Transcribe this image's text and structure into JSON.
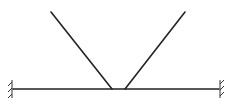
{
  "diagram": {
    "type": "structural-mechanics",
    "stroke_color": "#222222",
    "beam": {
      "x1": 13,
      "y1": 89,
      "x2": 219,
      "y2": 89
    },
    "members": [
      {
        "name": "left-strut",
        "x1": 51,
        "y1": 12,
        "x2": 112,
        "y2": 89
      },
      {
        "name": "right-strut",
        "x1": 185,
        "y1": 12,
        "x2": 125,
        "y2": 89
      }
    ],
    "supports": [
      {
        "name": "left-fixed-support",
        "x": 13,
        "y": 89,
        "side": "left"
      },
      {
        "name": "right-fixed-support",
        "x": 219,
        "y": 89,
        "side": "right"
      }
    ]
  }
}
